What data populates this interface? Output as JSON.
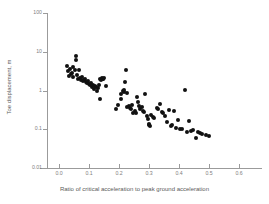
{
  "chart_data": {
    "type": "scatter",
    "title": "",
    "xlabel": "Ratio of critical acceleration to peak ground acceleration",
    "ylabel": "Toe displacement, m",
    "xscale": "linear",
    "yscale": "log",
    "xlim": [
      -0.04,
      0.6
    ],
    "ylim": [
      0.01,
      100
    ],
    "xticks": [
      0.0,
      0.1,
      0.2,
      0.3,
      0.4,
      0.5,
      0.6
    ],
    "xticklabels": [
      "0.0",
      "0.1",
      "0.2",
      "0.3",
      "0.4",
      "0.5",
      "0.6"
    ],
    "yticks": [
      0.01,
      0.1,
      1,
      10,
      100
    ],
    "yticklabels": [
      "0.01",
      "0.1",
      "1",
      "10",
      "100"
    ],
    "grid": false,
    "legend": null,
    "marker": {
      "shape": "circle",
      "color": "#111111",
      "size": 4
    },
    "series": [
      {
        "name": "Toe displacement data",
        "points": [
          [
            0.027,
            4.2
          ],
          [
            0.03,
            3.1
          ],
          [
            0.032,
            2.3
          ],
          [
            0.038,
            3.5
          ],
          [
            0.04,
            2.6
          ],
          [
            0.043,
            2.9
          ],
          [
            0.046,
            4.0
          ],
          [
            0.048,
            2.2
          ],
          [
            0.052,
            3.3
          ],
          [
            0.055,
            6.0
          ],
          [
            0.058,
            8.0
          ],
          [
            0.06,
            2.5
          ],
          [
            0.063,
            2.0
          ],
          [
            0.066,
            3.4
          ],
          [
            0.07,
            2.1
          ],
          [
            0.073,
            1.9
          ],
          [
            0.076,
            2.2
          ],
          [
            0.08,
            1.8
          ],
          [
            0.083,
            1.9
          ],
          [
            0.086,
            2.0
          ],
          [
            0.09,
            1.7
          ],
          [
            0.093,
            1.6
          ],
          [
            0.096,
            1.8
          ],
          [
            0.1,
            1.5
          ],
          [
            0.103,
            1.4
          ],
          [
            0.106,
            1.6
          ],
          [
            0.11,
            1.2
          ],
          [
            0.113,
            1.35
          ],
          [
            0.116,
            1.1
          ],
          [
            0.119,
            1.3
          ],
          [
            0.122,
            1.25
          ],
          [
            0.126,
            1.0
          ],
          [
            0.129,
            1.15
          ],
          [
            0.132,
            1.4
          ],
          [
            0.136,
            2.0
          ],
          [
            0.139,
            1.9
          ],
          [
            0.142,
            2.1
          ],
          [
            0.145,
            2.0
          ],
          [
            0.148,
            1.95
          ],
          [
            0.15,
            2.05
          ],
          [
            0.135,
            0.62
          ],
          [
            0.155,
            1.3
          ],
          [
            0.19,
            0.33
          ],
          [
            0.196,
            0.42
          ],
          [
            0.205,
            0.6
          ],
          [
            0.208,
            0.8
          ],
          [
            0.212,
            0.95
          ],
          [
            0.215,
            1.05
          ],
          [
            0.218,
            0.9
          ],
          [
            0.22,
            1.65
          ],
          [
            0.222,
            3.4
          ],
          [
            0.225,
            0.85
          ],
          [
            0.228,
            0.38
          ],
          [
            0.232,
            0.4
          ],
          [
            0.236,
            0.36
          ],
          [
            0.24,
            0.34
          ],
          [
            0.244,
            0.42
          ],
          [
            0.248,
            0.26
          ],
          [
            0.252,
            0.3
          ],
          [
            0.256,
            0.27
          ],
          [
            0.26,
            0.66
          ],
          [
            0.263,
            0.52
          ],
          [
            0.267,
            0.4
          ],
          [
            0.271,
            0.33
          ],
          [
            0.275,
            0.38
          ],
          [
            0.28,
            0.3
          ],
          [
            0.284,
            0.28
          ],
          [
            0.288,
            0.81
          ],
          [
            0.292,
            0.22
          ],
          [
            0.296,
            0.18
          ],
          [
            0.299,
            0.13
          ],
          [
            0.301,
            0.14
          ],
          [
            0.303,
            0.12
          ],
          [
            0.308,
            0.23
          ],
          [
            0.313,
            0.21
          ],
          [
            0.318,
            0.2
          ],
          [
            0.325,
            0.36
          ],
          [
            0.33,
            0.33
          ],
          [
            0.336,
            0.44
          ],
          [
            0.342,
            0.28
          ],
          [
            0.348,
            0.26
          ],
          [
            0.354,
            0.22
          ],
          [
            0.36,
            0.15
          ],
          [
            0.366,
            0.32
          ],
          [
            0.372,
            0.12
          ],
          [
            0.378,
            0.13
          ],
          [
            0.384,
            0.3
          ],
          [
            0.39,
            0.11
          ],
          [
            0.396,
            0.17
          ],
          [
            0.402,
            0.1
          ],
          [
            0.41,
            0.1
          ],
          [
            0.42,
            1.05
          ],
          [
            0.428,
            0.085
          ],
          [
            0.434,
            0.16
          ],
          [
            0.44,
            0.09
          ],
          [
            0.448,
            0.095
          ],
          [
            0.456,
            0.06
          ],
          [
            0.462,
            0.085
          ],
          [
            0.47,
            0.082
          ],
          [
            0.478,
            0.075
          ],
          [
            0.49,
            0.07
          ],
          [
            0.5,
            0.068
          ]
        ]
      }
    ]
  }
}
